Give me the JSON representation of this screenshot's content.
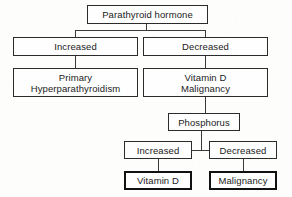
{
  "diagram": {
    "type": "flowchart",
    "colors": {
      "background": "#fdfdfc",
      "box_border": "#2b2b2b",
      "box_border_emphasis": "#111111",
      "box_fill": "#fefefe",
      "connector": "#3a3a3a",
      "text": "#1a1a1a"
    },
    "nodes": {
      "pth": {
        "label": "Parathyroid hormone"
      },
      "pth_increased": {
        "label": "Increased"
      },
      "pth_decreased": {
        "label": "Decreased"
      },
      "primary_hyperpara": {
        "line1": "Primary",
        "line2": "Hyperparathyroidism"
      },
      "vitd_malignancy": {
        "line1": "Vitamin D",
        "line2": "Malignancy"
      },
      "phosphorus": {
        "label": "Phosphorus"
      },
      "phos_increased": {
        "label": "Increased"
      },
      "phos_decreased": {
        "label": "Decreased"
      },
      "vitamin_d": {
        "label": "Vitamin D"
      },
      "malignancy": {
        "label": "Malignancy"
      }
    },
    "edges": [
      {
        "from": "pth",
        "to": "pth_increased"
      },
      {
        "from": "pth",
        "to": "pth_decreased"
      },
      {
        "from": "pth_increased",
        "to": "primary_hyperpara"
      },
      {
        "from": "pth_decreased",
        "to": "vitd_malignancy"
      },
      {
        "from": "vitd_malignancy",
        "to": "phosphorus"
      },
      {
        "from": "phosphorus",
        "to": "phos_increased"
      },
      {
        "from": "phosphorus",
        "to": "phos_decreased"
      },
      {
        "from": "phos_increased",
        "to": "vitamin_d"
      },
      {
        "from": "phos_decreased",
        "to": "malignancy"
      }
    ]
  }
}
